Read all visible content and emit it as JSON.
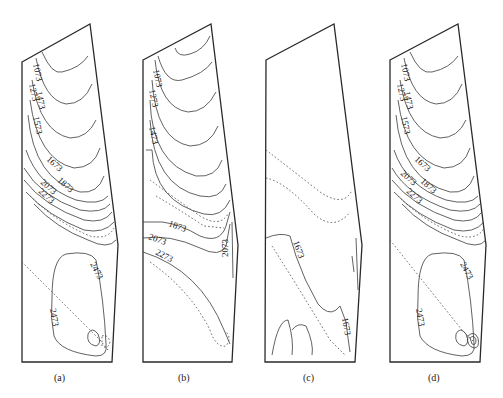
{
  "figure": {
    "panels": [
      {
        "id": "a",
        "caption": "(a)",
        "contour_labels": [
          "1073",
          "1273",
          "1473",
          "1573",
          "1673",
          "1873",
          "2073",
          "2273",
          "2473",
          "2473"
        ]
      },
      {
        "id": "b",
        "caption": "(b)",
        "contour_labels": [
          "1073",
          "1273",
          "1473",
          "1873",
          "2073",
          "2273",
          "2073"
        ]
      },
      {
        "id": "c",
        "caption": "(c)",
        "contour_labels": [
          "1673",
          "1673"
        ]
      },
      {
        "id": "d",
        "caption": "(d)",
        "contour_labels": [
          "1073",
          "1273",
          "1473",
          "1573",
          "1673",
          "2073",
          "1873",
          "2273",
          "2473",
          "2473"
        ]
      }
    ],
    "contour_levels": [
      1073,
      1273,
      1473,
      1573,
      1673,
      1873,
      2073,
      2273,
      2473
    ],
    "colors": {
      "line": "#2a2a2a",
      "background": "#ffffff"
    }
  }
}
